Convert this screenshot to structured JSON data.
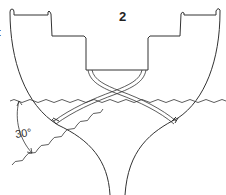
{
  "diagram": {
    "type": "ship hull cross-section with heel angle",
    "labels": {
      "compartment_number": "2",
      "left_edge_partial_text": "t",
      "heel_angle": "30°"
    },
    "elements": [
      "outer hull profile",
      "stepped deck / inner compartment outline",
      "crossing support straps",
      "level waterline",
      "heeled waterline (30° inclination)",
      "angle dimension arrow"
    ],
    "colors": {
      "line": "#333333",
      "background": "#ffffff"
    }
  }
}
